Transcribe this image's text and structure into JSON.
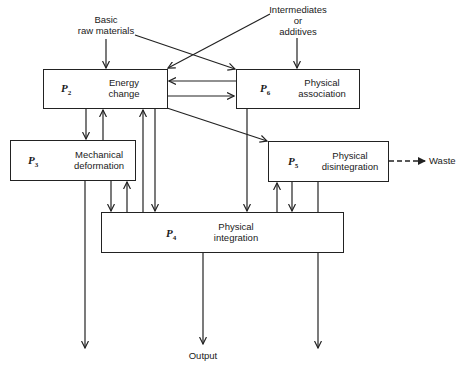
{
  "diagram": {
    "nodes": [
      {
        "id": "P2",
        "symbol": "P",
        "sub": "2",
        "label_line1": "Energy",
        "label_line2": "change"
      },
      {
        "id": "P6",
        "symbol": "P",
        "sub": "6",
        "label_line1": "Physical",
        "label_line2": "association"
      },
      {
        "id": "P3",
        "symbol": "P",
        "sub": "3",
        "label_line1": "Mechanical",
        "label_line2": "deformation"
      },
      {
        "id": "P5",
        "symbol": "P",
        "sub": "5",
        "label_line1": "Physical",
        "label_line2": "disintegration"
      },
      {
        "id": "P4",
        "symbol": "P",
        "sub": "4",
        "label_line1": "Physical",
        "label_line2": "integration"
      }
    ],
    "inputs": {
      "raw_line1": "Basic",
      "raw_line2": "raw materials",
      "inter_line1": "Intermediates",
      "inter_line2": "or",
      "inter_line3": "additives"
    },
    "outputs": {
      "waste": "Waste",
      "output": "Output"
    },
    "edges": [
      {
        "from": "Basic raw materials",
        "to": "P2"
      },
      {
        "from": "Basic raw materials",
        "to": "P6"
      },
      {
        "from": "Intermediates or additives",
        "to": "P6"
      },
      {
        "from": "Intermediates or additives",
        "to": "P2"
      },
      {
        "from": "P6",
        "to": "P2"
      },
      {
        "from": "P2",
        "to": "P6"
      },
      {
        "from": "P2",
        "to": "P3"
      },
      {
        "from": "P3",
        "to": "P2"
      },
      {
        "from": "P2",
        "to": "P5"
      },
      {
        "from": "P2",
        "to": "P4"
      },
      {
        "from": "P4",
        "to": "P2"
      },
      {
        "from": "P3",
        "to": "P4"
      },
      {
        "from": "P4",
        "to": "P3"
      },
      {
        "from": "P6",
        "to": "P4"
      },
      {
        "from": "P5",
        "to": "P4"
      },
      {
        "from": "P4",
        "to": "P5"
      },
      {
        "from": "P5",
        "to": "Waste",
        "style": "dashed"
      },
      {
        "from": "P4",
        "to": "Output"
      },
      {
        "from": "P3",
        "to": "bottom exit"
      },
      {
        "from": "P5",
        "to": "bottom exit"
      }
    ]
  }
}
